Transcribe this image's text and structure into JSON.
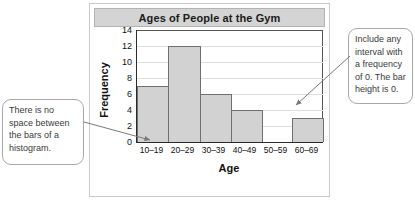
{
  "chart_data": {
    "type": "bar",
    "title": "Ages of People at the Gym",
    "xlabel": "Age",
    "ylabel": "Frequency",
    "categories": [
      "10–19",
      "20–29",
      "30–39",
      "40–49",
      "50–59",
      "60–69"
    ],
    "values": [
      7,
      12,
      6,
      4,
      0,
      3
    ],
    "ylim": [
      0,
      14
    ],
    "ytick_values": [
      0,
      2,
      4,
      6,
      8,
      10,
      12,
      14
    ],
    "ytick_labels": [
      "0",
      "2",
      "4",
      "6",
      "8",
      "10",
      "12",
      "14"
    ],
    "grid": "horizontal",
    "legend": "none",
    "bar_fill_color": "#d2d2d2",
    "bar_edge_color": "#6f6f6f",
    "axis_color": "#2b2b2b",
    "gridline_color": "#dedede",
    "title_band_color": "#d4d4d4"
  },
  "annotations": {
    "left_callout": "There is no space between the bars of a histogram.",
    "right_callout": "Include any interval with a frequency of 0. The bar height is 0."
  }
}
